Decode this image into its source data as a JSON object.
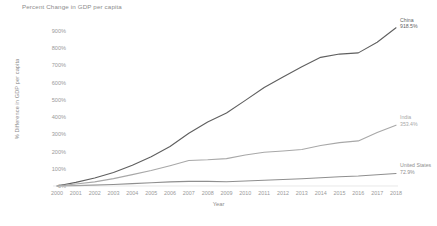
{
  "chart_data": {
    "type": "line",
    "title": "Percent Change in GDP per capita",
    "xlabel": "Year",
    "ylabel": "% Difference in GDP per capita",
    "grid": false,
    "legend_position": "end-of-line-labels",
    "xlim": [
      2000,
      2018
    ],
    "ylim": [
      0,
      900
    ],
    "y_tick_labels": [
      "900%",
      "800%",
      "700%",
      "600%",
      "500%",
      "400%",
      "300%",
      "200%",
      "100%",
      "0%"
    ],
    "y_tick_values": [
      900,
      800,
      700,
      600,
      500,
      400,
      300,
      200,
      100,
      0
    ],
    "categories": [
      2000,
      2001,
      2002,
      2003,
      2004,
      2005,
      2006,
      2007,
      2008,
      2009,
      2010,
      2011,
      2012,
      2013,
      2014,
      2015,
      2016,
      2017,
      2018
    ],
    "x_tick_labels": [
      "2000",
      "2001",
      "2002",
      "2003",
      "2004",
      "2005",
      "2006",
      "2007",
      "2008",
      "2009",
      "2010",
      "2011",
      "2012",
      "2013",
      "2014",
      "2015",
      "2016",
      "2017",
      "2018"
    ],
    "series": [
      {
        "name": "China",
        "color": "#5f5f5f",
        "end_value_label": "918.5%",
        "end_value": 918.5,
        "values": [
          0,
          21,
          46,
          78,
          121,
          170,
          229,
          306,
          372,
          424,
          497,
          572,
          633,
          692,
          747,
          766,
          773,
          835,
          918.5
        ]
      },
      {
        "name": "India",
        "color": "#a8a8a8",
        "end_value_label": "353.4%",
        "end_value": 353.4,
        "values": [
          0,
          12,
          24,
          43,
          66,
          90,
          118,
          148,
          152,
          159,
          180,
          196,
          203,
          212,
          235,
          252,
          262,
          310,
          353.4
        ]
      },
      {
        "name": "United States",
        "color": "#8f8f8f",
        "end_value_label": "72.9%",
        "end_value": 72.9,
        "values": [
          0,
          2,
          5,
          9,
          14,
          19,
          24,
          27,
          27,
          25,
          29,
          33,
          38,
          42,
          48,
          54,
          58,
          65,
          72.9
        ]
      }
    ]
  },
  "caption": ""
}
